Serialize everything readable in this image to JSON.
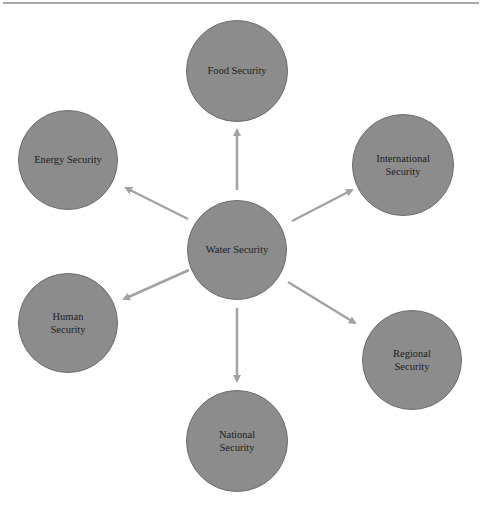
{
  "diagram": {
    "type": "hub-and-spoke",
    "colors": {
      "node_fill": "#8c8c8c",
      "node_border": "#6e6e6e",
      "arrow": "#a3a3a3",
      "text": "#1e1e1e",
      "top_rule": "#a8a8a8"
    },
    "center": {
      "id": "water",
      "label": "Water Security"
    },
    "nodes": [
      {
        "id": "food",
        "label": "Food Security"
      },
      {
        "id": "energy",
        "label": "Energy Security"
      },
      {
        "id": "international",
        "label": "International\nSecurity"
      },
      {
        "id": "human",
        "label": "Human\nSecurity"
      },
      {
        "id": "regional",
        "label": "Regional\nSecurity"
      },
      {
        "id": "national",
        "label": "National\nSecurity"
      }
    ],
    "edges": [
      {
        "from": "water",
        "to": "food"
      },
      {
        "from": "water",
        "to": "energy"
      },
      {
        "from": "water",
        "to": "international"
      },
      {
        "from": "water",
        "to": "human"
      },
      {
        "from": "water",
        "to": "regional"
      },
      {
        "from": "water",
        "to": "national"
      }
    ]
  }
}
